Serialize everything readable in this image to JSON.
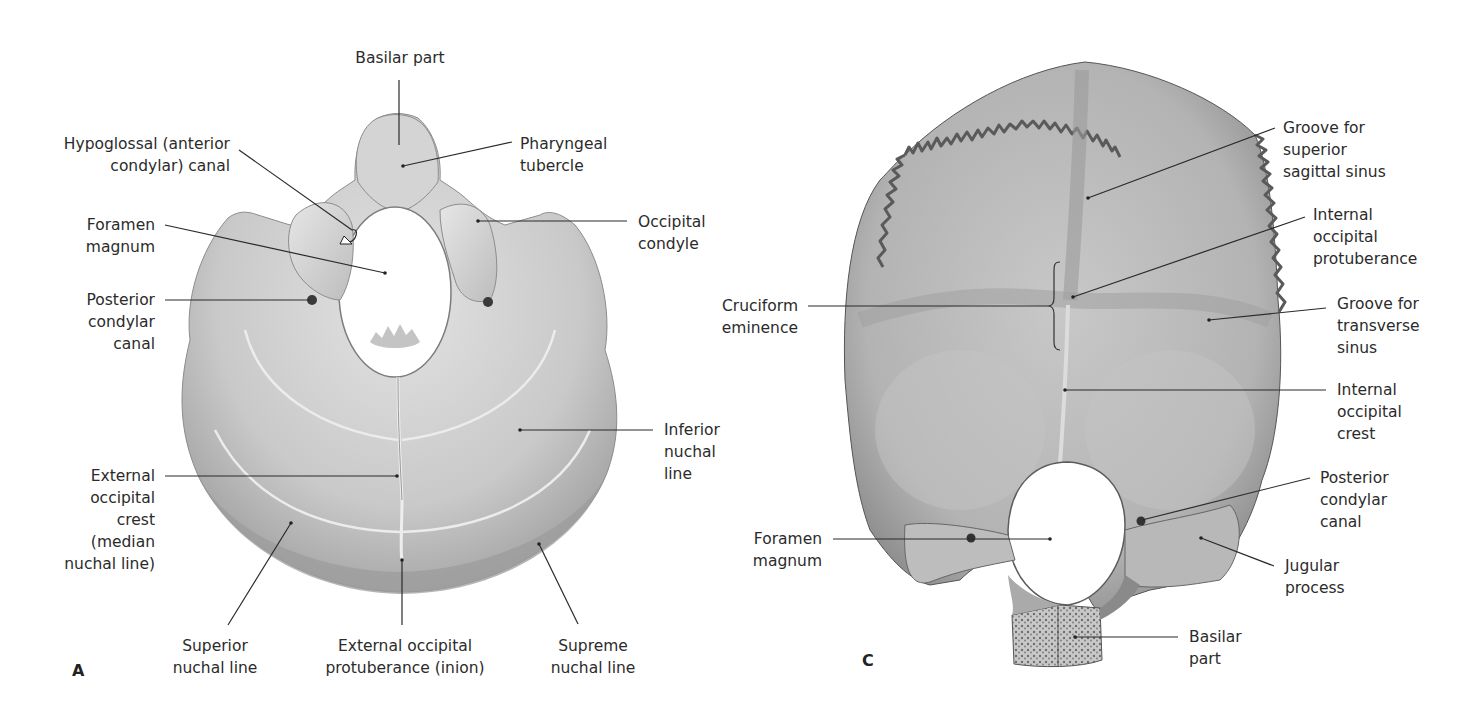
{
  "figure": {
    "panel_a": {
      "letter": "A",
      "view": "inferior view of occipital bone",
      "labels": {
        "basilar_part": "Basilar part",
        "hypoglossal_canal_1": "Hypoglossal (anterior",
        "hypoglossal_canal_2": "condylar) canal",
        "pharyngeal_tubercle_1": "Pharyngeal",
        "pharyngeal_tubercle_2": "tubercle",
        "foramen_magnum_1": "Foramen",
        "foramen_magnum_2": "magnum",
        "occipital_condyle_1": "Occipital",
        "occipital_condyle_2": "condyle",
        "posterior_condylar_canal_1": "Posterior",
        "posterior_condylar_canal_2": "condylar",
        "posterior_condylar_canal_3": "canal",
        "inferior_nuchal_line_1": "Inferior",
        "inferior_nuchal_line_2": "nuchal",
        "inferior_nuchal_line_3": "line",
        "external_occipital_crest_1": "External",
        "external_occipital_crest_2": "occipital",
        "external_occipital_crest_3": "crest",
        "external_occipital_crest_4": "(median",
        "external_occipital_crest_5": "nuchal line)",
        "superior_nuchal_line_1": "Superior",
        "superior_nuchal_line_2": "nuchal line",
        "external_occipital_protuberance_1": "External occipital",
        "external_occipital_protuberance_2": "protuberance (inion)",
        "supreme_nuchal_line_1": "Supreme",
        "supreme_nuchal_line_2": "nuchal line"
      }
    },
    "panel_c": {
      "letter": "C",
      "view": "internal view of occipital bone",
      "labels": {
        "groove_superior_sagittal_1": "Groove for",
        "groove_superior_sagittal_2": "superior",
        "groove_superior_sagittal_3": "sagittal sinus",
        "internal_occipital_protuberance_1": "Internal",
        "internal_occipital_protuberance_2": "occipital",
        "internal_occipital_protuberance_3": "protuberance",
        "cruciform_eminence_1": "Cruciform",
        "cruciform_eminence_2": "eminence",
        "groove_transverse_1": "Groove for",
        "groove_transverse_2": "transverse",
        "groove_transverse_3": "sinus",
        "internal_occipital_crest_1": "Internal",
        "internal_occipital_crest_2": "occipital",
        "internal_occipital_crest_3": "crest",
        "posterior_condylar_canal_1": "Posterior",
        "posterior_condylar_canal_2": "condylar",
        "posterior_condylar_canal_3": "canal",
        "foramen_magnum_1": "Foramen",
        "foramen_magnum_2": "magnum",
        "jugular_process_1": "Jugular",
        "jugular_process_2": "process",
        "basilar_part_1": "Basilar",
        "basilar_part_2": "part"
      }
    },
    "colors": {
      "bone_light": "#d9d9d9",
      "bone_mid": "#b9b9b9",
      "bone_dark": "#8a8a8a",
      "leader_line": "#2a2a2a",
      "text": "#2b2b2b"
    }
  }
}
